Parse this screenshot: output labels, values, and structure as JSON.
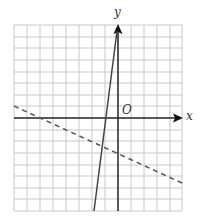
{
  "graph": {
    "x_axis_label": "x",
    "y_axis_label": "y",
    "origin_label": "O",
    "grid": {
      "columns": 13,
      "rows": 16,
      "units_left_of_y_axis": 8,
      "units_right_of_y_axis": 5,
      "units_above_x_axis": 8,
      "units_below_x_axis": 8
    },
    "colors": {
      "grid": "#c8c8c8",
      "axes": "#222222",
      "lines": "#444444"
    },
    "lines": [
      {
        "name": "solid-line",
        "style": "solid",
        "from": [
          -0.1,
          7.5
        ],
        "to": [
          -1.9,
          -8
        ]
      },
      {
        "name": "dashed-line",
        "style": "dashed",
        "from": [
          -8,
          1
        ],
        "to": [
          5,
          -5.6
        ]
      }
    ]
  }
}
